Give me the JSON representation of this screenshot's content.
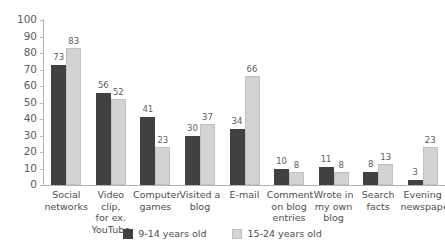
{
  "chart_data": {
    "type": "bar",
    "title": "",
    "subtitle": "",
    "xlabel": "",
    "ylabel": "",
    "ylim": [
      0,
      100
    ],
    "yticks": [
      0,
      10,
      20,
      30,
      40,
      50,
      60,
      70,
      80,
      90,
      100
    ],
    "grid": false,
    "legend_position": "bottom-center",
    "categories": [
      "Social\nnetworks",
      "Video clip,\nfor ex.\nYouTube",
      "Computer\ngames",
      "Visited a\nblog",
      "E-mail",
      "Comment\non blog\nentries",
      "Wrote in\nmy own\nblog",
      "Search\nfacts",
      "Evening\nnewspaper"
    ],
    "series": [
      {
        "name": "9-14 years old",
        "color": "#414141",
        "values": [
          73,
          56,
          41,
          30,
          34,
          10,
          11,
          8,
          3
        ]
      },
      {
        "name": "15-24 years old",
        "color": "#d3d3d3",
        "values": [
          83,
          52,
          23,
          37,
          66,
          8,
          8,
          13,
          23
        ]
      }
    ]
  }
}
